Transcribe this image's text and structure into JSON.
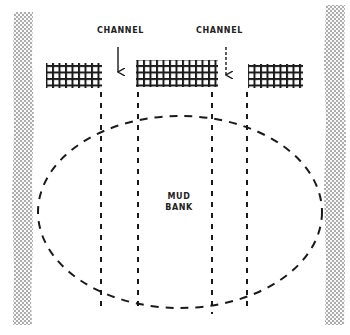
{
  "diagram": {
    "labels": {
      "channel_left": "CHANNEL",
      "channel_right": "CHANNEL",
      "mud_line1": "MUD",
      "mud_line2": "BANK"
    },
    "colors": {
      "ink": "#1a1a1a",
      "bank_stipple": "#333333",
      "background": "#ffffff"
    },
    "banks": [
      {
        "side": "left",
        "x": 13,
        "y": 12,
        "width": 20,
        "height": 313
      },
      {
        "side": "right",
        "x": 325,
        "y": 5,
        "width": 20,
        "height": 320
      }
    ],
    "grid_blocks": [
      {
        "name": "left",
        "x": 46,
        "y": 63,
        "width": 56,
        "height": 25
      },
      {
        "name": "center",
        "x": 136,
        "y": 60,
        "width": 82,
        "height": 27
      },
      {
        "name": "right",
        "x": 248,
        "y": 64,
        "width": 55,
        "height": 24
      }
    ],
    "channel_arrows": [
      {
        "x": 118,
        "y1": 47,
        "y2": 72
      },
      {
        "x": 226,
        "y1": 47,
        "y2": 75
      }
    ],
    "dashed_verticals": [
      {
        "x": 101,
        "y1": 92,
        "y2": 310
      },
      {
        "x": 138,
        "y1": 92,
        "y2": 312
      },
      {
        "x": 212,
        "y1": 92,
        "y2": 314
      },
      {
        "x": 247,
        "y1": 92,
        "y2": 312
      }
    ],
    "mud_bank_outline": {
      "cx": 180,
      "cy": 212,
      "rx": 142,
      "ry": 96
    }
  }
}
